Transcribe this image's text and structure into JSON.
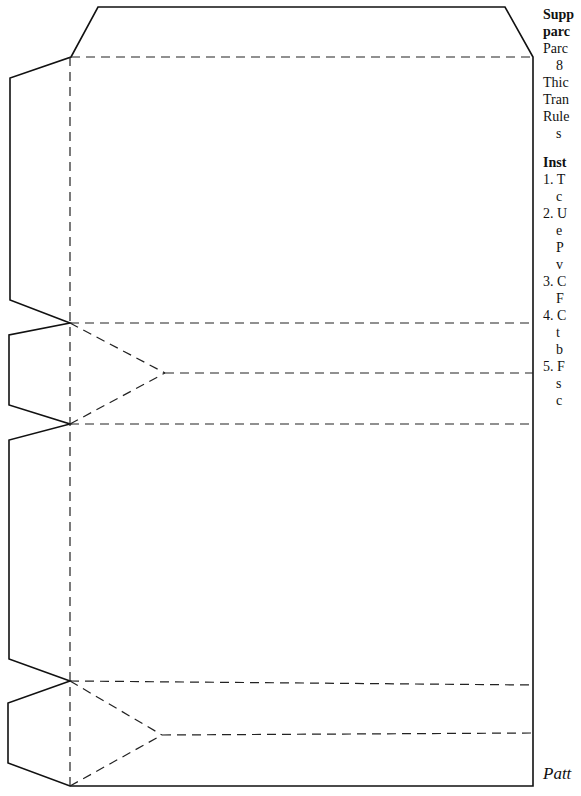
{
  "supplies": {
    "title_line1": "Supp",
    "title_line2": "parc",
    "lines": [
      {
        "text": "Parc",
        "indent": false
      },
      {
        "text": "8",
        "indent": true
      },
      {
        "text": "Thic",
        "indent": false
      },
      {
        "text": "Tran",
        "indent": false
      },
      {
        "text": "Rule",
        "indent": false
      },
      {
        "text": "s",
        "indent": true
      }
    ]
  },
  "instructions": {
    "title": "Inst",
    "lines": [
      {
        "text": "1. T",
        "indent": false
      },
      {
        "text": "c",
        "indent": true
      },
      {
        "text": "2. U",
        "indent": false
      },
      {
        "text": "e",
        "indent": true
      },
      {
        "text": "P",
        "indent": true
      },
      {
        "text": "v",
        "indent": true
      },
      {
        "text": "3. C",
        "indent": false
      },
      {
        "text": "F",
        "indent": true
      },
      {
        "text": "4. C",
        "indent": false
      },
      {
        "text": "t",
        "indent": true
      },
      {
        "text": "b",
        "indent": true
      },
      {
        "text": "5. F",
        "indent": false
      },
      {
        "text": "s",
        "indent": true
      },
      {
        "text": "c",
        "indent": true
      }
    ]
  },
  "caption": "Patt",
  "pattern": {
    "stroke_color": "#111111",
    "cut_outline": "98,7 505,7 533,57 533,786 70,786 8,763 8,703 70,681 9,659 9,440 70,424 9,405 9,335 70,323 10,300 10,78 71,57",
    "fold_lines": [
      {
        "name": "top-flap-fold",
        "d": "M71,57 L533,57"
      },
      {
        "name": "left-spine-fold",
        "d": "M70,57 L70,786"
      },
      {
        "name": "fold-1",
        "d": "M70,323 L533,323"
      },
      {
        "name": "gusset-1-upper",
        "d": "M70,323 L165,373"
      },
      {
        "name": "gusset-1-lower",
        "d": "M70,424 L165,373"
      },
      {
        "name": "gusset-1-center",
        "d": "M165,373 L533,373"
      },
      {
        "name": "fold-2",
        "d": "M70,424 L533,424"
      },
      {
        "name": "fold-3",
        "d": "M70,681 L533,685"
      },
      {
        "name": "gusset-2-upper",
        "d": "M70,681 L162,735"
      },
      {
        "name": "gusset-2-lower",
        "d": "M70,786 L162,735"
      },
      {
        "name": "gusset-2-center",
        "d": "M162,735 L533,733"
      }
    ]
  }
}
